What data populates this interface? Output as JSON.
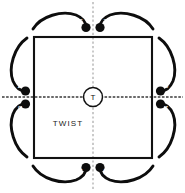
{
  "figure": {
    "interior_label": "TWIST",
    "center_axis_label": "T",
    "arrows": [
      {
        "id": "top-left",
        "label": "S"
      },
      {
        "id": "top-right",
        "label": "Z"
      },
      {
        "id": "left-upper",
        "label": "Z"
      },
      {
        "id": "left-lower",
        "label": "S"
      },
      {
        "id": "right-upper",
        "label": "S"
      },
      {
        "id": "right-lower",
        "label": "Z"
      },
      {
        "id": "bottom-left",
        "label": "Z"
      },
      {
        "id": "bottom-right",
        "label": "S"
      }
    ],
    "colors": {
      "stroke": "#0d0d0d",
      "square": "#111111",
      "axis_horizontal": "#3a3a3a",
      "axis_vertical": "#b9b9b9",
      "background": "#ffffff",
      "label_on_head": "#ffffff"
    }
  }
}
